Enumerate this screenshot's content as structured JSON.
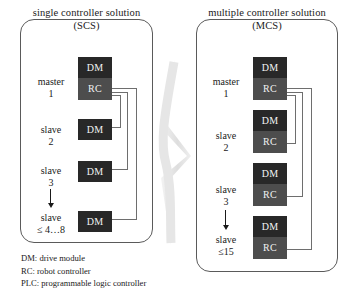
{
  "diagram": {
    "title_hidden": "",
    "panels": [
      {
        "id": "scs",
        "title_line1": "single controller solution",
        "title_line2": "(SCS)",
        "rows": [
          {
            "label_line1": "master",
            "label_line2": "1",
            "modules": [
              "DM",
              "RC"
            ]
          },
          {
            "label_line1": "slave",
            "label_line2": "2",
            "modules": [
              "DM"
            ]
          },
          {
            "label_line1": "slave",
            "label_line2": "3",
            "modules": [
              "DM"
            ]
          },
          {
            "label_line1": "slave",
            "label_line2": "≤ 4…8",
            "modules": [
              "DM"
            ]
          }
        ]
      },
      {
        "id": "mcs",
        "title_line1": "multiple controller solution",
        "title_line2": "(MCS)",
        "rows": [
          {
            "label_line1": "master",
            "label_line2": "1",
            "modules": [
              "DM",
              "RC"
            ]
          },
          {
            "label_line1": "slave",
            "label_line2": "2",
            "modules": [
              "DM",
              "RC"
            ]
          },
          {
            "label_line1": "slave",
            "label_line2": "3",
            "modules": [
              "DM",
              "RC"
            ]
          },
          {
            "label_line1": "slave",
            "label_line2": "≤15",
            "modules": [
              "DM",
              "RC"
            ]
          }
        ]
      }
    ],
    "module_labels": {
      "dm": "DM",
      "rc": "RC"
    },
    "legend": [
      "DM: drive module",
      "RC: robot controller",
      "PLC: programmable logic controller"
    ],
    "colors": {
      "dm_box": "#282828",
      "rc_box": "#4d4d4d",
      "box_text": "#f2f2f2",
      "panel_border": "#5a5a5a",
      "connector": "#6e6e6e",
      "arrow": "#1a1a1a",
      "leaf": "#e3e3e3",
      "background": "#ffffff",
      "text": "#1a1a1a"
    }
  }
}
